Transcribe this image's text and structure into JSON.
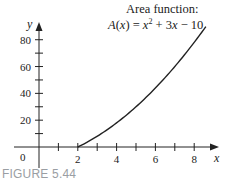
{
  "chart_data": {
    "type": "line",
    "title": "Area function:",
    "subtitle": "A(x) = x² + 3x − 10",
    "function": "A(x) = x^2 + 3x - 10",
    "xlabel": "x",
    "ylabel": "y",
    "xlim": [
      -1.9,
      9.2
    ],
    "ylim": [
      0,
      92
    ],
    "x_ticks": [
      1,
      2,
      3,
      4,
      5,
      6,
      7,
      8
    ],
    "x_tick_labels": [
      "2",
      "4",
      "6",
      "8"
    ],
    "x_tick_label_values": [
      2,
      4,
      6,
      8
    ],
    "y_ticks": [
      10,
      20,
      30,
      40,
      50,
      60,
      70,
      80
    ],
    "y_tick_labels": [
      "20",
      "40",
      "60",
      "80"
    ],
    "y_tick_label_values": [
      20,
      40,
      60,
      80
    ],
    "origin_label": "0",
    "grid": false,
    "series": [
      {
        "name": "A(x)",
        "x": [
          2,
          3,
          4,
          5,
          6,
          7,
          8,
          8.6
        ],
        "values": [
          0,
          8,
          18,
          30,
          44,
          60,
          78,
          89.8
        ]
      }
    ]
  },
  "caption": "FIGURE 5.44"
}
